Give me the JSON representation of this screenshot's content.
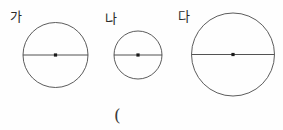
{
  "figure": {
    "background_color": "#fefefe",
    "stroke_color": "#4a4a4a",
    "dot_color": "#1a1a1a",
    "label_color": "#2b2b2b",
    "canvas": {
      "width": 283,
      "height": 130
    },
    "shapes": [
      {
        "id": "circle-ga",
        "label": "가",
        "label_x": 10,
        "label_y": 10,
        "center_x": 55.5,
        "center_y": 55,
        "radius": 32.5,
        "diameter": 65,
        "dot_size": 3.2,
        "diameter_line": {
          "x1": 23,
          "y1": 55,
          "x2": 88,
          "y2": 55
        }
      },
      {
        "id": "circle-na",
        "label": "나",
        "label_x": 105,
        "label_y": 12,
        "center_x": 138,
        "center_y": 55,
        "radius": 24,
        "diameter": 48,
        "dot_size": 3.2,
        "diameter_line": {
          "x1": 114,
          "y1": 55,
          "x2": 162,
          "y2": 55
        }
      },
      {
        "id": "circle-da",
        "label": "다",
        "label_x": 178,
        "label_y": 10,
        "center_x": 233,
        "center_y": 54.5,
        "radius": 41.5,
        "diameter": 83,
        "dot_size": 3.2,
        "diameter_line": {
          "x1": 191.5,
          "y1": 54.5,
          "x2": 274.5,
          "y2": 54.5
        }
      }
    ],
    "annotation": {
      "text": "(",
      "x": 114,
      "y": 107
    }
  }
}
